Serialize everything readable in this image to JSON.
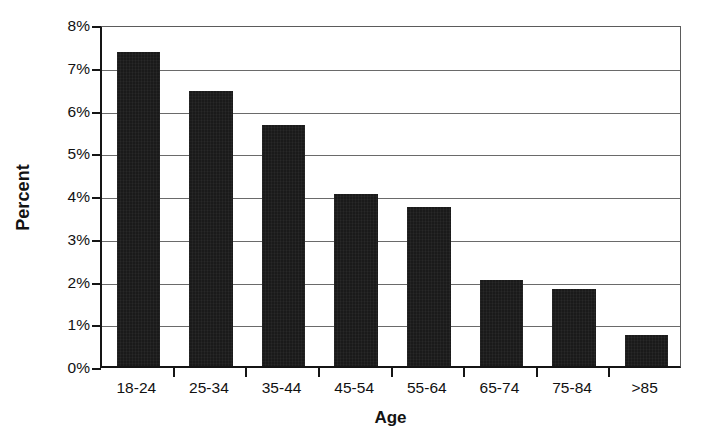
{
  "chart_data": {
    "type": "bar",
    "title": "",
    "xlabel": "Age",
    "ylabel": "Percent",
    "categories": [
      "18-24",
      "25-34",
      "35-44",
      "45-54",
      "55-64",
      "65-74",
      "75-84",
      ">85"
    ],
    "values": [
      7.35,
      6.44,
      5.64,
      4.02,
      3.72,
      2.01,
      1.79,
      0.72
    ],
    "ylim": [
      0,
      8
    ],
    "ytick_values": [
      0,
      1,
      2,
      3,
      4,
      5,
      6,
      7,
      8
    ],
    "ytick_labels": [
      "0%",
      "1%",
      "2%",
      "3%",
      "4%",
      "5%",
      "6%",
      "7%",
      "8%"
    ],
    "value_format": "percent",
    "grid": "horizontal",
    "legend": "none",
    "bar_color": "#1a1a1a",
    "axis_color": "#151515",
    "gridline_color": "#6a6a6a",
    "background_color": "#ffffff"
  }
}
